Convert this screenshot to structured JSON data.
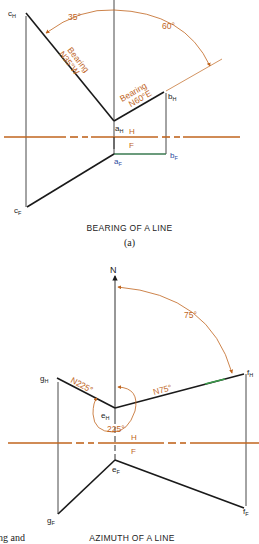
{
  "figure_a": {
    "caption": "BEARING OF A LINE",
    "sublabel": "(a)",
    "points": {
      "cH": {
        "main": "c",
        "sub": "H"
      },
      "aH": {
        "main": "a",
        "sub": "H"
      },
      "bH": {
        "main": "b",
        "sub": "H"
      },
      "aF": {
        "main": "a",
        "sub": "F"
      },
      "bF": {
        "main": "b",
        "sub": "F"
      },
      "cF": {
        "main": "c",
        "sub": "F"
      }
    },
    "angle_left": "35°",
    "angle_right": "60°",
    "bearing_left_line1": "Bearing",
    "bearing_left_line2": "N35°W",
    "bearing_right_line1": "Bearing",
    "bearing_right_line2": "N60°E",
    "fold_top": "H",
    "fold_bottom": "F"
  },
  "figure_b": {
    "caption": "AZIMUTH OF A LINE",
    "north": "N",
    "points": {
      "gH": {
        "main": "g",
        "sub": "H"
      },
      "eH": {
        "main": "e",
        "sub": "H"
      },
      "fH": {
        "main": "f",
        "sub": "H"
      },
      "eF": {
        "main": "e",
        "sub": "F"
      },
      "gF": {
        "main": "g",
        "sub": "F"
      },
      "fF": {
        "main": "f",
        "sub": "F"
      }
    },
    "angle_75": "75°",
    "azimuth_left": "N225°",
    "azimuth_right": "N75°",
    "angle_225": "225°",
    "fold_top": "H",
    "fold_bottom": "F"
  },
  "margin_text": "ng and",
  "colors": {
    "line": "#1a1a1a",
    "accent": "#c0651e",
    "blue": "#2b4aa0",
    "green": "#3a9a4a"
  }
}
